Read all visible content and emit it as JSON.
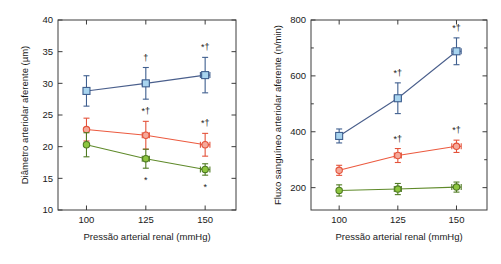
{
  "figure": {
    "panels": [
      {
        "id": "left",
        "xlabel": "Pressão arterial renal (mmHg)",
        "ylabel": "Diâmetro arteriolar aferente (µm)"
      },
      {
        "id": "right",
        "xlabel": "Pressão arterial renal (mmHg)",
        "ylabel": "Fluxo sanguíneo arteriolar aferente (n/min)"
      }
    ]
  },
  "colors": {
    "blue_fill": "#a8d4ef",
    "blue_edge": "#3f5f8f",
    "blue_line": "#4a5f8c",
    "red_fill": "#f5a99a",
    "red_edge": "#e4533b",
    "red_line": "#ec5a3f",
    "green_fill": "#8dc63f",
    "green_edge": "#4f7a22",
    "green_line": "#5f8a2a",
    "axis": "#3c3c3c",
    "text": "#1a1a1a"
  },
  "chart_data": [
    {
      "type": "line",
      "title": "",
      "xlabel": "Pressão arterial renal (mmHg)",
      "ylabel": "Diâmetro arteriolar aferente (µm)",
      "x": [
        100,
        125,
        150
      ],
      "xticklabels": [
        "100",
        "125",
        "150"
      ],
      "xlim": [
        88,
        163
      ],
      "ylim": [
        10,
        40
      ],
      "yticks": [
        10,
        15,
        20,
        25,
        30,
        35,
        40
      ],
      "yticklabels": [
        "10",
        "15",
        "20",
        "25",
        "30",
        "35",
        "40"
      ],
      "grid": false,
      "legend": "none",
      "series": [
        {
          "name": "blue",
          "marker": "square",
          "values": [
            28.8,
            30.0,
            31.3
          ],
          "yerr": [
            2.4,
            2.5,
            2.8
          ],
          "xerr": [
            0,
            1.5,
            2.0
          ],
          "annotations": [
            "",
            "†",
            "*†"
          ],
          "annotation_pos": [
            "",
            "above",
            "above"
          ]
        },
        {
          "name": "red",
          "marker": "circle",
          "values": [
            22.7,
            21.8,
            20.3
          ],
          "yerr": [
            1.8,
            2.2,
            1.8
          ],
          "xerr": [
            0,
            1.5,
            2.0
          ],
          "annotations": [
            "",
            "*†",
            "*†"
          ],
          "annotation_pos": [
            "",
            "above",
            "above"
          ]
        },
        {
          "name": "green",
          "marker": "circle",
          "values": [
            20.3,
            18.1,
            16.4
          ],
          "yerr": [
            1.9,
            1.5,
            0.9
          ],
          "xerr": [
            0,
            1.5,
            2.0
          ],
          "annotations": [
            "",
            "*",
            "*"
          ],
          "annotation_pos": [
            "",
            "below",
            "below"
          ]
        }
      ]
    },
    {
      "type": "line",
      "title": "",
      "xlabel": "Pressão arterial renal (mmHg)",
      "ylabel": "Fluxo sanguíneo arteriolar aferente (n/min)",
      "x": [
        100,
        125,
        150
      ],
      "xticklabels": [
        "100",
        "125",
        "150"
      ],
      "xlim": [
        88,
        163
      ],
      "ylim": [
        120,
        800
      ],
      "yticks": [
        200,
        300,
        400,
        500,
        600,
        700,
        800
      ],
      "ymajorticks": [
        200,
        400,
        600,
        800
      ],
      "yticklabels": [
        "200",
        "400",
        "600",
        "800"
      ],
      "grid": false,
      "legend": "none",
      "series": [
        {
          "name": "blue",
          "marker": "square",
          "values": [
            385,
            520,
            688
          ],
          "yerr": [
            25,
            55,
            48
          ],
          "xerr": [
            0,
            1.5,
            2.0
          ],
          "annotations": [
            "",
            "*†",
            "*†"
          ],
          "annotation_pos": [
            "",
            "above",
            "above"
          ]
        },
        {
          "name": "red",
          "marker": "circle",
          "values": [
            262,
            315,
            348
          ],
          "yerr": [
            18,
            25,
            22
          ],
          "xerr": [
            0,
            1.5,
            2.0
          ],
          "annotations": [
            "",
            "*†",
            "*†"
          ],
          "annotation_pos": [
            "",
            "above",
            "above"
          ]
        },
        {
          "name": "green",
          "marker": "circle",
          "values": [
            190,
            195,
            202
          ],
          "yerr": [
            20,
            20,
            18
          ],
          "xerr": [
            0,
            1.5,
            2.0
          ],
          "annotations": [
            "",
            "",
            ""
          ],
          "annotation_pos": [
            "",
            "",
            ""
          ]
        }
      ]
    }
  ]
}
